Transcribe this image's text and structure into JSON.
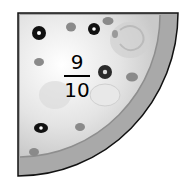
{
  "image": {
    "subject": "pizza quarter slice",
    "fraction": {
      "numerator": "9",
      "denominator": "10"
    },
    "colors": {
      "crust": "#a8a8a8",
      "cheese": "#e6e6e6",
      "outline": "#111111",
      "topping_dark": "#111111",
      "topping_gray": "#8a8a8a"
    }
  }
}
